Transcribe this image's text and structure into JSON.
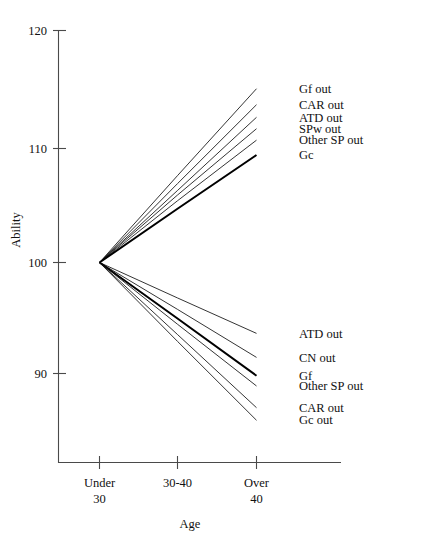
{
  "chart_data": {
    "type": "line",
    "title": "",
    "xlabel": "Age",
    "ylabel": "Ability",
    "grid": false,
    "legend_position": "right-inline-labels",
    "categories": [
      "Under 30",
      "30-40",
      "Over 40"
    ],
    "x_tick_labels": [
      {
        "line1": "Under",
        "line2": "30"
      },
      {
        "line1": "30-40",
        "line2": ""
      },
      {
        "line1": "Over",
        "line2": "40"
      }
    ],
    "y_tick_labels": [
      "120",
      "110",
      "100",
      "90"
    ],
    "y_ticks": [
      120,
      110,
      100,
      90
    ],
    "ylim": [
      85,
      121
    ],
    "x": [
      "Under 30",
      "30-40",
      "Over 40"
    ],
    "origin_value": 100,
    "series": [
      {
        "name": "Gf out",
        "group": "upper",
        "emphasis": "normal",
        "values": [
          100,
          107.6,
          115.2
        ]
      },
      {
        "name": "CAR out",
        "group": "upper",
        "emphasis": "normal",
        "values": [
          100,
          106.9,
          113.8
        ]
      },
      {
        "name": "ATD out",
        "group": "upper",
        "emphasis": "normal",
        "values": [
          100,
          106.3,
          112.7
        ]
      },
      {
        "name": "SPw out",
        "group": "upper",
        "emphasis": "normal",
        "values": [
          100,
          105.9,
          111.7
        ]
      },
      {
        "name": "Other SP out",
        "group": "upper",
        "emphasis": "normal",
        "values": [
          100,
          105.4,
          110.7
        ]
      },
      {
        "name": "Gc",
        "group": "upper",
        "emphasis": "bold",
        "values": [
          100,
          104.7,
          109.4
        ]
      },
      {
        "name": "ATD out",
        "group": "lower",
        "emphasis": "normal",
        "values": [
          100,
          96.9,
          93.8
        ]
      },
      {
        "name": "CN out",
        "group": "lower",
        "emphasis": "normal",
        "values": [
          100,
          95.9,
          91.7
        ]
      },
      {
        "name": "Gf",
        "group": "lower",
        "emphasis": "bold",
        "values": [
          100,
          95.1,
          90.1
        ]
      },
      {
        "name": "Other SP out",
        "group": "lower",
        "emphasis": "normal",
        "values": [
          100,
          94.6,
          89.2
        ]
      },
      {
        "name": "CAR out",
        "group": "lower",
        "emphasis": "normal",
        "values": [
          100,
          93.7,
          87.3
        ]
      },
      {
        "name": "Gc out",
        "group": "lower",
        "emphasis": "normal",
        "values": [
          100,
          93.1,
          86.2
        ]
      }
    ],
    "upper_labels": [
      "Gf out",
      "CAR out",
      "ATD out",
      "SPw out",
      "Other SP out",
      "Gc"
    ],
    "lower_labels": [
      "ATD out",
      "CN out",
      "Gf",
      "Other SP out",
      "CAR out",
      "Gc out"
    ],
    "colors": {
      "line": "#111111",
      "bold_line": "#000000",
      "axis": "#4a4a4a",
      "text": "#111111",
      "background": "#ffffff"
    }
  }
}
